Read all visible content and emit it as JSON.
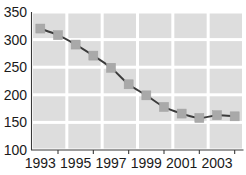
{
  "chart_data": {
    "type": "line",
    "title": "",
    "subtitle": "",
    "xlabel": "",
    "ylabel": "",
    "x": [
      1993,
      1994,
      1995,
      1996,
      1997,
      1998,
      1999,
      2000,
      2001,
      2002,
      2003,
      2004
    ],
    "values": [
      320,
      308,
      291,
      271,
      249,
      219,
      199,
      178,
      166,
      158,
      163,
      161
    ],
    "series": [
      {
        "name": "series-1",
        "values": [
          320,
          308,
          291,
          271,
          249,
          219,
          199,
          178,
          166,
          158,
          163,
          161
        ]
      }
    ],
    "xlim": [
      1992.5,
      2004.5
    ],
    "ylim": [
      100,
      350
    ],
    "yticks": [
      100,
      150,
      200,
      250,
      300,
      350
    ],
    "ytick_labels": [
      "100",
      "150",
      "200",
      "250",
      "300",
      "350"
    ],
    "xticks": [
      1993,
      1994,
      1995,
      1996,
      1997,
      1998,
      1999,
      2000,
      2001,
      2002,
      2003,
      2004
    ],
    "xtick_labels_shown": [
      "1993",
      "1995",
      "1997",
      "1999",
      "2001",
      "2003"
    ],
    "xtick_label_values": [
      1993,
      1995,
      1997,
      1999,
      2001,
      2003
    ],
    "grid": true,
    "grid_style": "shaded-blocks",
    "grid_columns": 6,
    "grid_rows": 5,
    "legend": false,
    "legend_position": "none",
    "marker": "square",
    "colors": {
      "line": "#3b3b3b",
      "marker": "#a9a9a9",
      "grid_block": "#dddddd",
      "axis": "#3a3a3a",
      "background": "#ffffff",
      "text": "#1a1a1a"
    }
  }
}
